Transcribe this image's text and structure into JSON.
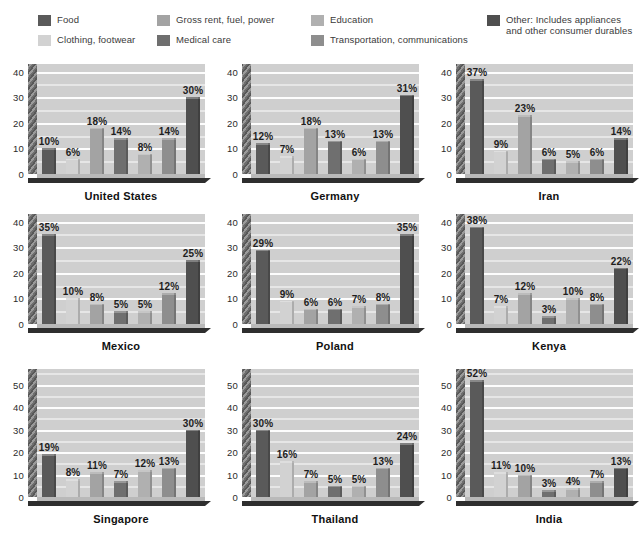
{
  "legend": {
    "columns": [
      {
        "x": 38,
        "items": [
          {
            "label": "Food",
            "color": "#5a5a5a",
            "swatch_name": "legend-swatch-food"
          },
          {
            "label": "Clothing, footwear",
            "color": "#d2d2d2",
            "swatch_name": "legend-swatch-clothing"
          }
        ]
      },
      {
        "x": 157,
        "items": [
          {
            "label": "Gross rent, fuel, power",
            "color": "#a3a3a3",
            "swatch_name": "legend-swatch-gross-rent"
          },
          {
            "label": "Medical care",
            "color": "#6f6f6f",
            "swatch_name": "legend-swatch-medical-care"
          }
        ]
      },
      {
        "x": 311,
        "items": [
          {
            "label": "Education",
            "color": "#b0b0b0",
            "swatch_name": "legend-swatch-education"
          },
          {
            "label": "Transportation, communications",
            "color": "#8e8e8e",
            "swatch_name": "legend-swatch-transportation"
          }
        ]
      },
      {
        "x": 487,
        "items": [
          {
            "label": "Other: Includes appliances and other consumer durables",
            "color": "#4f4f4f",
            "swatch_name": "legend-swatch-other",
            "wrap": true
          }
        ]
      }
    ]
  },
  "chart_data": {
    "type": "bar",
    "title": "",
    "xlabel": "",
    "ylabel": "",
    "grid": true,
    "legend_position": "top",
    "categories": [
      "Food",
      "Clothing, footwear",
      "Gross rent, fuel, power",
      "Medical care",
      "Education",
      "Transportation, communications",
      "Other: Includes appliances and other consumer durables"
    ],
    "category_colors": [
      "#5a5a5a",
      "#d2d2d2",
      "#a3a3a3",
      "#6f6f6f",
      "#b0b0b0",
      "#8e8e8e",
      "#4f4f4f"
    ],
    "value_unit": "%",
    "panels": [
      {
        "name": "United States",
        "ylim": [
          0,
          43
        ],
        "yticks": [
          0,
          10,
          20,
          30,
          40
        ],
        "values": [
          10,
          6,
          18,
          14,
          8,
          14,
          30
        ],
        "labels": [
          "10%",
          "6%",
          "18%",
          "14%",
          "8%",
          "14%",
          "30%"
        ]
      },
      {
        "name": "Germany",
        "ylim": [
          0,
          43
        ],
        "yticks": [
          0,
          10,
          20,
          30,
          40
        ],
        "values": [
          12,
          7,
          18,
          13,
          6,
          13,
          31
        ],
        "labels": [
          "12%",
          "7%",
          "18%",
          "13%",
          "6%",
          "13%",
          "31%"
        ]
      },
      {
        "name": "Iran",
        "ylim": [
          0,
          43
        ],
        "yticks": [
          0,
          10,
          20,
          30,
          40
        ],
        "values": [
          37,
          9,
          23,
          6,
          5,
          6,
          14
        ],
        "labels": [
          "37%",
          "9%",
          "23%",
          "6%",
          "5%",
          "6%",
          "14%"
        ]
      },
      {
        "name": "Mexico",
        "ylim": [
          0,
          43
        ],
        "yticks": [
          0,
          10,
          20,
          30,
          40
        ],
        "values": [
          35,
          10,
          8,
          5,
          5,
          12,
          25
        ],
        "labels": [
          "35%",
          "10%",
          "8%",
          "5%",
          "5%",
          "12%",
          "25%"
        ]
      },
      {
        "name": "Poland",
        "ylim": [
          0,
          43
        ],
        "yticks": [
          0,
          10,
          20,
          30,
          40
        ],
        "values": [
          29,
          9,
          6,
          6,
          7,
          8,
          35
        ],
        "labels": [
          "29%",
          "9%",
          "6%",
          "6%",
          "7%",
          "8%",
          "35%"
        ]
      },
      {
        "name": "Kenya",
        "ylim": [
          0,
          43
        ],
        "yticks": [
          0,
          10,
          20,
          30,
          40
        ],
        "values": [
          38,
          7,
          12,
          3,
          10,
          8,
          22
        ],
        "labels": [
          "38%",
          "7%",
          "12%",
          "3%",
          "10%",
          "8%",
          "22%"
        ]
      },
      {
        "name": "Singapore",
        "ylim": [
          0,
          57
        ],
        "yticks": [
          0,
          10,
          20,
          30,
          40,
          50
        ],
        "values": [
          19,
          8,
          11,
          7,
          12,
          13,
          30
        ],
        "labels": [
          "19%",
          "8%",
          "11%",
          "7%",
          "12%",
          "13%",
          "30%"
        ]
      },
      {
        "name": "Thailand",
        "ylim": [
          0,
          57
        ],
        "yticks": [
          0,
          10,
          20,
          30,
          40,
          50
        ],
        "values": [
          30,
          16,
          7,
          5,
          5,
          13,
          24
        ],
        "labels": [
          "30%",
          "16%",
          "7%",
          "5%",
          "5%",
          "13%",
          "24%"
        ]
      },
      {
        "name": "India",
        "ylim": [
          0,
          57
        ],
        "yticks": [
          0,
          10,
          20,
          30,
          40,
          50
        ],
        "values": [
          52,
          11,
          10,
          3,
          4,
          7,
          13
        ],
        "labels": [
          "52%",
          "11%",
          "10%",
          "3%",
          "4%",
          "7%",
          "13%"
        ]
      }
    ]
  }
}
